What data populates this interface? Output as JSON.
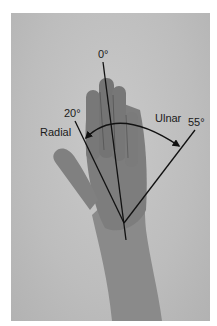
{
  "figure": {
    "labels": {
      "neutral_angle": "0°",
      "radial_angle": "20°",
      "ulnar_angle": "55°",
      "radial_label": "Radial",
      "ulnar_label": "Ulnar"
    },
    "colors": {
      "background": "#bebebe",
      "skin": "#7a7a7a",
      "lines": "#111111"
    }
  }
}
